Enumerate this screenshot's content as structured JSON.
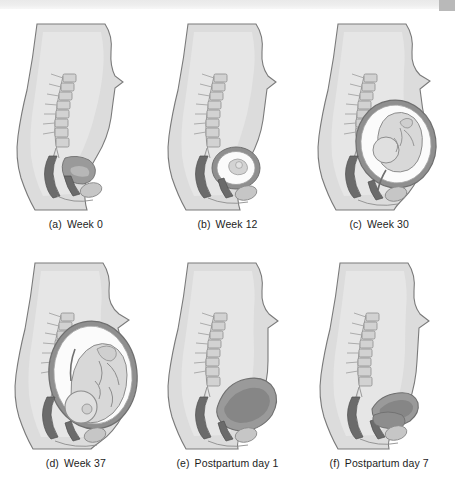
{
  "figure": {
    "type": "anatomical-illustration-grid",
    "columns": 3,
    "rows": 2,
    "palette": {
      "background": "#ffffff",
      "body_silhouette": "#dcdcdc",
      "body_outline": "#6f6f6f",
      "inner_body": "#e6e6e6",
      "bone_light": "#d2d2d2",
      "bone_outline": "#8d8d8d",
      "organ_dark": "#6b6b6b",
      "organ_mid": "#9a9a9a",
      "uterus_wall": "#8f8f8f",
      "amniotic_fluid": "#fbfbfb",
      "fetus_fill": "#d8d8d8",
      "caption_text": "#1d1d1d",
      "scan_band": "#e9e9e9",
      "scan_corner": "#b9b9b9"
    }
  },
  "panels": [
    {
      "letter": "(a)",
      "label": "Week 0",
      "stage": "non-pregnant",
      "uterus_size": "small",
      "fetus_present": false,
      "abdomen_profile": "flat"
    },
    {
      "letter": "(b)",
      "label": "Week 12",
      "stage": "first-trimester",
      "uterus_size": "grapefruit",
      "fetus_present": true,
      "abdomen_profile": "slightly-rounded"
    },
    {
      "letter": "(c)",
      "label": "Week 30",
      "stage": "third-trimester",
      "uterus_size": "large",
      "fetus_present": true,
      "abdomen_profile": "prominent"
    },
    {
      "letter": "(d)",
      "label": "Week 37",
      "stage": "full-term",
      "uterus_size": "full-term",
      "fetus_present": true,
      "abdomen_profile": "maximal"
    },
    {
      "letter": "(e)",
      "label": "Postpartum day 1",
      "stage": "early-involution",
      "uterus_size": "umbilicus-level",
      "fetus_present": false,
      "abdomen_profile": "soft-rounded"
    },
    {
      "letter": "(f)",
      "label": "Postpartum day 7",
      "stage": "late-involution",
      "uterus_size": "midway-to-symphysis",
      "fetus_present": false,
      "abdomen_profile": "reduced"
    }
  ]
}
